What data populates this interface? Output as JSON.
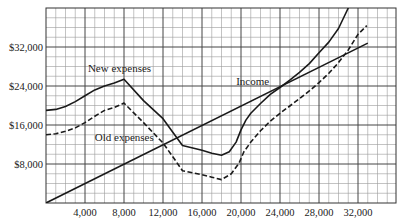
{
  "chart_data": {
    "type": "line",
    "title": "",
    "xlabel": "",
    "ylabel": "",
    "xlim": [
      0,
      35000
    ],
    "ylim": [
      0,
      40000
    ],
    "grid": true,
    "x_major_ticks": [
      4000,
      8000,
      12000,
      16000,
      20000,
      24000,
      28000,
      32000
    ],
    "x_tick_labels": [
      "4,000",
      "8,000",
      "12,000",
      "16,000",
      "20,000",
      "24,000",
      "28,000",
      "32,000"
    ],
    "y_major_ticks": [
      8000,
      16000,
      24000,
      32000
    ],
    "y_tick_labels": [
      "$8,000",
      "$16,000",
      "$24,000",
      "$32,000"
    ],
    "x_minor_step": 1000,
    "y_minor_step": 2000,
    "series": [
      {
        "name": "New expenses",
        "style": "solid",
        "points": [
          [
            0,
            19000
          ],
          [
            1000,
            19200
          ],
          [
            2000,
            19800
          ],
          [
            3000,
            20800
          ],
          [
            4000,
            22000
          ],
          [
            5000,
            23200
          ],
          [
            6000,
            24000
          ],
          [
            7000,
            24600
          ],
          [
            8000,
            25400
          ],
          [
            10000,
            21000
          ],
          [
            12000,
            17300
          ],
          [
            13000,
            14500
          ],
          [
            14000,
            11800
          ],
          [
            16000,
            10800
          ],
          [
            17000,
            10200
          ],
          [
            18000,
            9800
          ],
          [
            18800,
            10500
          ],
          [
            19500,
            12500
          ],
          [
            20000,
            15000
          ],
          [
            20500,
            17000
          ],
          [
            21000,
            18400
          ],
          [
            22000,
            20400
          ],
          [
            23000,
            22300
          ],
          [
            24000,
            23700
          ],
          [
            25000,
            25200
          ],
          [
            26000,
            26800
          ],
          [
            27000,
            28600
          ],
          [
            28000,
            30800
          ],
          [
            29000,
            33000
          ],
          [
            30000,
            35800
          ],
          [
            31000,
            40000
          ]
        ]
      },
      {
        "name": "Old expenses",
        "style": "dashed",
        "points": [
          [
            0,
            14000
          ],
          [
            1000,
            14200
          ],
          [
            2000,
            14700
          ],
          [
            3000,
            15400
          ],
          [
            4000,
            16500
          ],
          [
            5000,
            17800
          ],
          [
            6000,
            19000
          ],
          [
            7000,
            19600
          ],
          [
            8000,
            20500
          ],
          [
            10000,
            16500
          ],
          [
            12000,
            12300
          ],
          [
            13000,
            9500
          ],
          [
            14000,
            6600
          ],
          [
            16000,
            5800
          ],
          [
            17000,
            5300
          ],
          [
            18000,
            4800
          ],
          [
            19000,
            6000
          ],
          [
            19800,
            8200
          ],
          [
            20300,
            10500
          ],
          [
            21000,
            12500
          ],
          [
            22000,
            14800
          ],
          [
            23000,
            16800
          ],
          [
            24000,
            18400
          ],
          [
            25000,
            19900
          ],
          [
            26000,
            21400
          ],
          [
            27000,
            23000
          ],
          [
            28000,
            24700
          ],
          [
            29000,
            26600
          ],
          [
            30000,
            28800
          ],
          [
            31000,
            31400
          ],
          [
            32000,
            34600
          ],
          [
            32900,
            36400
          ]
        ]
      },
      {
        "name": "Income",
        "style": "solid",
        "points": [
          [
            0,
            0
          ],
          [
            33000,
            32800
          ]
        ]
      }
    ],
    "annotations": [
      {
        "text": "New expenses",
        "x": 4300,
        "y": 26800
      },
      {
        "text": "Old expenses",
        "x": 5000,
        "y": 12800
      },
      {
        "text": "Income",
        "x": 19500,
        "y": 24200
      }
    ]
  },
  "colors": {
    "line": "#1a1a1a",
    "grid_major": "#444444",
    "grid_minor": "#9a9a9a",
    "background": "#ffffff"
  }
}
